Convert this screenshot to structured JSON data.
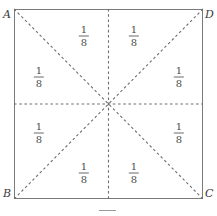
{
  "figure": {
    "square": {
      "left": 14,
      "top": 9,
      "width": 189,
      "height": 190,
      "stroke_color": "#7a7a7a"
    },
    "center": {
      "x": 108.5,
      "y": 104
    },
    "dashed_line_color": "#6e6e6e",
    "vertices": [
      {
        "name": "vertex-a",
        "label": "A",
        "position": "top-left"
      },
      {
        "name": "vertex-d",
        "label": "D",
        "position": "top-right"
      },
      {
        "name": "vertex-b",
        "label": "B",
        "position": "bottom-left"
      },
      {
        "name": "vertex-c",
        "label": "C",
        "position": "bottom-right"
      }
    ],
    "sectors": [
      {
        "name": "sector-top-left",
        "numerator": "1",
        "denominator": "8",
        "x": 84,
        "y": 36
      },
      {
        "name": "sector-top-right",
        "numerator": "1",
        "denominator": "8",
        "x": 134,
        "y": 36
      },
      {
        "name": "sector-left-upper",
        "numerator": "1",
        "denominator": "8",
        "x": 39,
        "y": 77
      },
      {
        "name": "sector-right-upper",
        "numerator": "1",
        "denominator": "8",
        "x": 179,
        "y": 77
      },
      {
        "name": "sector-left-lower",
        "numerator": "1",
        "denominator": "8",
        "x": 39,
        "y": 133
      },
      {
        "name": "sector-right-lower",
        "numerator": "1",
        "denominator": "8",
        "x": 179,
        "y": 133
      },
      {
        "name": "sector-bottom-left",
        "numerator": "1",
        "denominator": "8",
        "x": 84,
        "y": 173
      },
      {
        "name": "sector-bottom-right",
        "numerator": "1",
        "denominator": "8",
        "x": 134,
        "y": 173
      }
    ]
  }
}
